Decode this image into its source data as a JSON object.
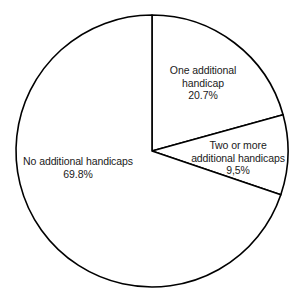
{
  "chart_data": {
    "type": "pie",
    "title": "",
    "subtitle": "",
    "xlabel": "",
    "ylabel": "",
    "legend_position": "none",
    "grid": false,
    "units": "percent",
    "start_angle_deg": 0,
    "direction": "clockwise",
    "categories": [
      "One additional handicap",
      "Two or more additional handicaps",
      "No additional handicaps"
    ],
    "values": [
      20.7,
      9.5,
      69.8
    ],
    "slices": [
      {
        "label": "One additional handicap",
        "label_line1": "One additional",
        "label_line2": "handicap",
        "value": 20.7,
        "value_text": "20.7%",
        "start_angle_deg": 0,
        "end_angle_deg": 74.52,
        "fill": "#ffffff",
        "stroke": "#000000"
      },
      {
        "label": "Two or more additional handicaps",
        "label_line1": "Two or more",
        "label_line2": "additional handicaps",
        "value": 9.5,
        "value_text": "9,5%",
        "start_angle_deg": 74.52,
        "end_angle_deg": 108.72,
        "fill": "#ffffff",
        "stroke": "#000000"
      },
      {
        "label": "No additional handicaps",
        "label_line1": "No additional handicaps",
        "label_line2": "",
        "value": 69.8,
        "value_text": "69.8%",
        "start_angle_deg": 108.72,
        "end_angle_deg": 360,
        "fill": "#ffffff",
        "stroke": "#000000"
      }
    ]
  },
  "geometry": {
    "center_x": 152,
    "center_y": 151,
    "radius": 136
  },
  "colors": {
    "background": "#ffffff",
    "stroke": "#000000",
    "text": "#1a1a1a"
  }
}
